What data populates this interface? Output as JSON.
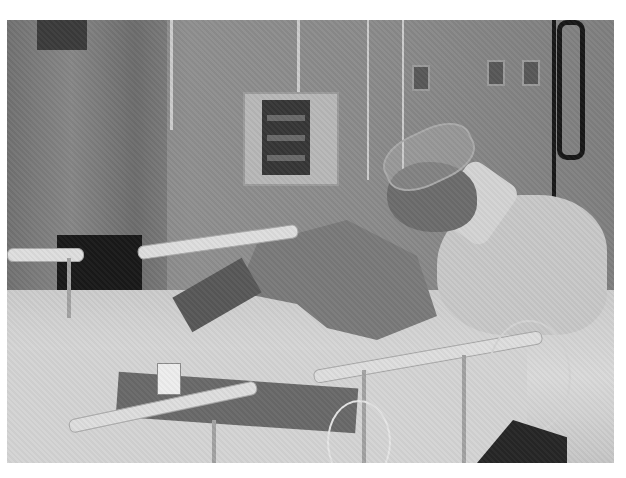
{
  "image": {
    "description": "Grayscale photograph of a patient lying in a hospital ICU bed, surrounded by monitoring equipment, IV lines and tubing",
    "color_mode": "grayscale",
    "scene": {
      "setting": "hospital intensive care unit",
      "elements": [
        "curtain",
        "IV poles",
        "infusion pump / monitor",
        "wall outlets",
        "coiled cable",
        "patient in bed",
        "pillows",
        "bed rails",
        "patient wristband",
        "tubing"
      ]
    }
  }
}
